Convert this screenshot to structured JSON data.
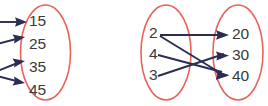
{
  "figure": {
    "background_color": "#ffffff",
    "width": 268,
    "height": 106,
    "colors": {
      "ellipse_stroke": "#e8645a",
      "arrow": "#2b2d52",
      "label_text": "#3a3a3a"
    }
  },
  "diagrams": [
    {
      "name": "left-mapping-diagram-partial",
      "note_clipped": "left source set is cut off by the image edge",
      "target_set": {
        "name": "left-diagram-range-set",
        "elements": [
          {
            "label": "15"
          },
          {
            "label": "25"
          },
          {
            "label": "35"
          },
          {
            "label": "45"
          }
        ]
      },
      "arrows": [
        {
          "name": "arrow-to-15",
          "to": "15"
        },
        {
          "name": "arrow-to-25",
          "to": "25"
        },
        {
          "name": "arrow-to-35",
          "to": "35"
        },
        {
          "name": "arrow-to-45",
          "to": "45"
        }
      ]
    },
    {
      "name": "right-mapping-diagram",
      "source_set": {
        "name": "right-diagram-domain-set",
        "elements": [
          {
            "label": "2"
          },
          {
            "label": "4"
          },
          {
            "label": "3"
          }
        ]
      },
      "target_set": {
        "name": "right-diagram-range-set",
        "elements": [
          {
            "label": "20"
          },
          {
            "label": "30"
          },
          {
            "label": "40"
          }
        ]
      },
      "arrows": [
        {
          "name": "arrow-2-to-20",
          "from": "2",
          "to": "20"
        },
        {
          "name": "arrow-2-to-40",
          "from": "2",
          "to": "40"
        },
        {
          "name": "arrow-4-to-40",
          "from": "4",
          "to": "40"
        },
        {
          "name": "arrow-3-to-30",
          "from": "3",
          "to": "30"
        }
      ]
    }
  ]
}
